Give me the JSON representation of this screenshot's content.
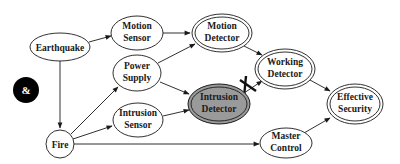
{
  "diagram": {
    "type": "directed-graph",
    "badge": {
      "label": "&",
      "color": "#000000"
    },
    "nodes": [
      {
        "id": "earthquake",
        "lines": [
          "Earthquake"
        ],
        "style": "single"
      },
      {
        "id": "motion_sensor",
        "lines": [
          "Motion",
          "Sensor"
        ],
        "style": "single"
      },
      {
        "id": "motion_detector",
        "lines": [
          "Motion",
          "Detector"
        ],
        "style": "double"
      },
      {
        "id": "power_supply",
        "lines": [
          "Power",
          "Supply"
        ],
        "style": "single"
      },
      {
        "id": "working_detector",
        "lines": [
          "Working",
          "Detector"
        ],
        "style": "double"
      },
      {
        "id": "intrusion_detector",
        "lines": [
          "Intrusion",
          "Detector"
        ],
        "style": "double-highlighted",
        "fill": "#9a9a9a"
      },
      {
        "id": "intrusion_sensor",
        "lines": [
          "Intrusion",
          "Sensor"
        ],
        "style": "single"
      },
      {
        "id": "effective_security",
        "lines": [
          "Effective",
          "Security"
        ],
        "style": "double"
      },
      {
        "id": "fire",
        "lines": [
          "Fire"
        ],
        "style": "single"
      },
      {
        "id": "master_control",
        "lines": [
          "Master",
          "Control"
        ],
        "style": "single"
      }
    ],
    "edges": [
      {
        "from": "earthquake",
        "to": "motion_sensor"
      },
      {
        "from": "earthquake",
        "to": "fire"
      },
      {
        "from": "motion_sensor",
        "to": "motion_detector"
      },
      {
        "from": "power_supply",
        "to": "motion_detector"
      },
      {
        "from": "power_supply",
        "to": "intrusion_detector"
      },
      {
        "from": "motion_detector",
        "to": "working_detector"
      },
      {
        "from": "intrusion_detector",
        "to": "working_detector",
        "cut": true
      },
      {
        "from": "working_detector",
        "to": "effective_security"
      },
      {
        "from": "intrusion_sensor",
        "to": "intrusion_detector"
      },
      {
        "from": "fire",
        "to": "power_supply"
      },
      {
        "from": "fire",
        "to": "intrusion_sensor"
      },
      {
        "from": "fire",
        "to": "master_control"
      },
      {
        "from": "master_control",
        "to": "effective_security"
      }
    ],
    "colors": {
      "stroke": "#1a1a1a",
      "highlight_fill": "#9a9a9a",
      "background": "#ffffff"
    }
  }
}
